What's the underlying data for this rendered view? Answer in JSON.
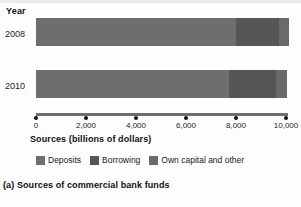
{
  "chart_data": {
    "type": "bar",
    "orientation": "horizontal",
    "stacked": true,
    "title": "",
    "caption": "(a) Sources of commercial bank funds",
    "xlabel": "Sources (billions of dollars)",
    "ylabel": "Year",
    "categories": [
      "2008",
      "2010"
    ],
    "xlim": [
      0,
      10000
    ],
    "xticks": [
      0,
      2000,
      4000,
      6000,
      8000,
      10000
    ],
    "xticklabels": [
      "0",
      "2,000",
      "4,000",
      "6,000",
      "8,000",
      "10,000"
    ],
    "grid": false,
    "legend_position": "bottom",
    "series": [
      {
        "name": "Deposits",
        "color": "#6e6e6e",
        "values": [
          8000,
          7700
        ]
      },
      {
        "name": "Borrowing",
        "color": "#565656",
        "values": [
          1700,
          1900
        ]
      },
      {
        "name": "Own capital and other",
        "color": "#6a6a6a",
        "values": [
          400,
          450
        ]
      }
    ],
    "totals": [
      10100,
      10050
    ]
  },
  "labels": {
    "year_axis": "Year",
    "axis_title": "Sources (billions of dollars)",
    "caption": "(a) Sources of commercial bank funds"
  },
  "ticks": [
    {
      "value": 0,
      "label": "0"
    },
    {
      "value": 2000,
      "label": "2,000"
    },
    {
      "value": 4000,
      "label": "4,000"
    },
    {
      "value": 6000,
      "label": "6,000"
    },
    {
      "value": 8000,
      "label": "8,000"
    },
    {
      "value": 10000,
      "label": "10,000"
    }
  ],
  "legend": [
    {
      "label": "Deposits",
      "color": "#6e6e6e"
    },
    {
      "label": "Borrowing",
      "color": "#565656"
    },
    {
      "label": "Own capital and other",
      "color": "#6a6a6a"
    }
  ],
  "rows": [
    {
      "year": "2008"
    },
    {
      "year": "2010"
    }
  ],
  "colors": {
    "deposits": "#6e6e6e",
    "borrowing": "#565656",
    "own_capital": "#6a6a6a",
    "axis": "#6e6e6e",
    "text": "#1a1a1a",
    "background": "#fdfdfd"
  }
}
